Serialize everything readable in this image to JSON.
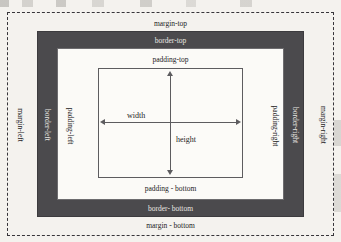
{
  "diagram": {
    "background_color": "#f4f2ee",
    "border_band_color": "#4b4a4d",
    "padding_band_color": "#fbfaf7",
    "content_fill_color": "#fcfbf8",
    "line_color": "#5d5c5f",
    "margin_boundary_style": "dashed"
  },
  "margin": {
    "top_label": "margin-top",
    "right_label": "margin-right",
    "bottom_label": "margin - bottom",
    "left_label": "margin-left"
  },
  "border": {
    "top_label": "border-top",
    "right_label": "border-right",
    "bottom_label": "border- bottom",
    "left_label": "border-left"
  },
  "padding": {
    "top_label": "padding-top",
    "right_label": "padding-right",
    "bottom_label": "padding - bottom",
    "left_label": "padding-left"
  },
  "content": {
    "width_label": "width",
    "height_label": "height"
  }
}
